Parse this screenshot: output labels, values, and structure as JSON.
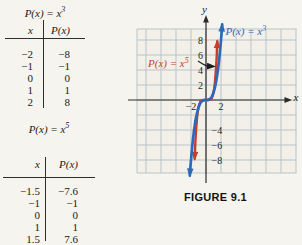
{
  "tables": [
    {
      "title_base": "P(x) = x",
      "title_exp": "3",
      "col_x": "x",
      "col_p": "P(x)",
      "rows": [
        {
          "x": "−2",
          "p": "−8"
        },
        {
          "x": "−1",
          "p": "−1"
        },
        {
          "x": "0",
          "p": "0"
        },
        {
          "x": "1",
          "p": "1"
        },
        {
          "x": "2",
          "p": "8"
        }
      ]
    },
    {
      "title_base": "P(x) = x",
      "title_exp": "5",
      "col_x": "x",
      "col_p": "P(x)",
      "rows": [
        {
          "x": "−1.5",
          "p": "−7.6"
        },
        {
          "x": "−1",
          "p": "−1"
        },
        {
          "x": "0",
          "p": "0"
        },
        {
          "x": "1",
          "p": "1"
        },
        {
          "x": "1.5",
          "p": "7.6"
        }
      ]
    }
  ],
  "figure": {
    "caption": "FIGURE 9.1"
  },
  "chart_data": {
    "type": "line",
    "title": "FIGURE 9.1",
    "xlabel": "x",
    "ylabel": "y",
    "xlim": [
      -9.2,
      12.1
    ],
    "ylim": [
      -9.8,
      9.5
    ],
    "grid": true,
    "grid_cell_units": 2,
    "x_tick_labels": [
      -2,
      2
    ],
    "y_tick_labels": [
      8,
      6,
      4,
      2,
      -4,
      -6,
      -8
    ],
    "colors": {
      "cubic_blue": "#2a6ab8",
      "quintic_red": "#cc3b28",
      "axis_black": "#2a2a2a",
      "grid_line": "#b9c5c9",
      "grid_bg": "#f2f0e9"
    },
    "series": [
      {
        "name": "P(x) = x^3",
        "label_base": "P(x) = x",
        "label_exp": "3",
        "exponent": 3,
        "color": "#2a6ab8",
        "x_range": [
          -2.16,
          2.16
        ],
        "points": [
          [
            -2,
            -8
          ],
          [
            -1,
            -1
          ],
          [
            0,
            0
          ],
          [
            1,
            1
          ],
          [
            2,
            8
          ]
        ]
      },
      {
        "name": "P(x) = x^5",
        "label_base": "P(x) = x",
        "label_exp": "5",
        "exponent": 5,
        "color": "#cc3b28",
        "x_range": [
          -1.51,
          1.51
        ],
        "points": [
          [
            -1.5,
            -7.6
          ],
          [
            -1,
            -1
          ],
          [
            0,
            0
          ],
          [
            1,
            1
          ],
          [
            1.5,
            7.6
          ]
        ]
      }
    ]
  }
}
